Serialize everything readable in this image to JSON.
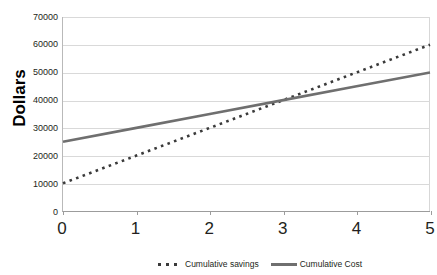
{
  "chart_data": {
    "type": "line",
    "title": "",
    "xlabel": "",
    "ylabel": "Dollars",
    "x": [
      0,
      1,
      2,
      3,
      4,
      5
    ],
    "xlim": [
      0,
      5
    ],
    "ylim": [
      0,
      70000
    ],
    "xticks": [
      "0",
      "1",
      "2",
      "3",
      "4",
      "5"
    ],
    "yticks": [
      "0",
      "10000",
      "20000",
      "30000",
      "40000",
      "50000",
      "60000",
      "70000"
    ],
    "ytick_values": [
      0,
      10000,
      20000,
      30000,
      40000,
      50000,
      60000,
      70000
    ],
    "grid": true,
    "legend_position": "bottom",
    "series": [
      {
        "name": "Cumulative savings",
        "style": "dotted",
        "color": "#3a3a3a",
        "values": [
          10000,
          20000,
          30000,
          40000,
          50000,
          60000
        ]
      },
      {
        "name": "Cumulative Cost",
        "style": "solid",
        "color": "#6f6f6f",
        "values": [
          25000,
          30000,
          35000,
          40000,
          45000,
          50000
        ]
      }
    ]
  },
  "axis": {
    "y_title": "Dollars"
  },
  "legend": {
    "items": [
      {
        "label": "Cumulative savings",
        "marker": "dashed-line-swatch"
      },
      {
        "label": "Cumulative Cost",
        "marker": "solid-line-swatch"
      }
    ]
  }
}
